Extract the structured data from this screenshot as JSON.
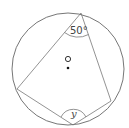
{
  "diagram": {
    "title_partial": "g",
    "circle": {
      "cx": 68,
      "cy": 69,
      "r": 56,
      "stroke": "#666666"
    },
    "center": {
      "label": "O",
      "dot_x": 68,
      "dot_y": 70
    },
    "vertices": {
      "top": {
        "x": 81,
        "y": 13
      },
      "left": {
        "x": 17,
        "y": 89
      },
      "bottom": {
        "x": 73,
        "y": 125
      },
      "right": {
        "x": 111,
        "y": 101
      }
    },
    "angles": [
      {
        "vertex": "top",
        "label": "50°"
      },
      {
        "vertex": "bottom",
        "label": "y"
      }
    ]
  }
}
